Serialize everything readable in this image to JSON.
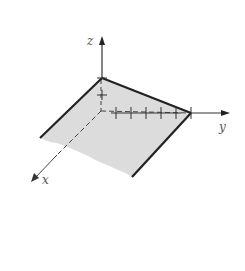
{
  "diagram": {
    "type": "3d-coordinate-plane",
    "axes": {
      "x": {
        "label": "x"
      },
      "y": {
        "label": "y"
      },
      "z": {
        "label": "z"
      }
    },
    "tick_marks": {
      "z_axis_count": 1,
      "y_axis_count": 6
    },
    "colors": {
      "plane_fill": "#d9d9d9",
      "edge": "#222222",
      "axis": "#333333",
      "label": "#555555"
    }
  }
}
